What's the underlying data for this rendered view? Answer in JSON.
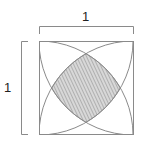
{
  "diagram": {
    "type": "geometry",
    "labels": {
      "top_dimension": "1",
      "left_dimension": "1"
    },
    "square": {
      "x": 39,
      "y": 41,
      "side": 94
    },
    "colors": {
      "line": "#8a8a8a",
      "hatch": "#9a9a9a",
      "hatch_bg": "#d8d8d8",
      "label": "#222222",
      "background": "#ffffff"
    }
  }
}
